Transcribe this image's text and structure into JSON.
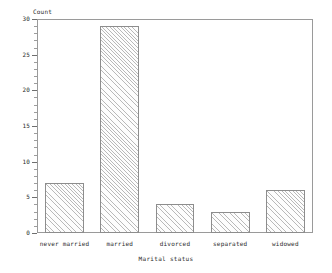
{
  "chart_data": {
    "type": "bar",
    "title": "",
    "subtitle": "",
    "xlabel": "Marital status",
    "ylabel": "Count",
    "categories": [
      "never married",
      "married",
      "divorced",
      "separated",
      "widowed"
    ],
    "values": [
      7,
      29,
      4,
      3,
      6
    ],
    "ylim": [
      0,
      30
    ],
    "ytick_labels": [
      "0",
      "5",
      "10",
      "15",
      "20",
      "25",
      "30"
    ],
    "ytick_values": [
      0,
      5,
      10,
      15,
      20,
      25,
      30
    ],
    "ytick_minor_step": 1,
    "grid": false,
    "legend": null,
    "legend_position": "none",
    "bar_fill": "diagonal-hatch",
    "bar_fill_color": "#b9b9b9",
    "bar_edge_color": "#8d8d8d",
    "axis_color": "#9a9a9a",
    "text_color": "#2a2a2a",
    "background": "#ffffff"
  }
}
